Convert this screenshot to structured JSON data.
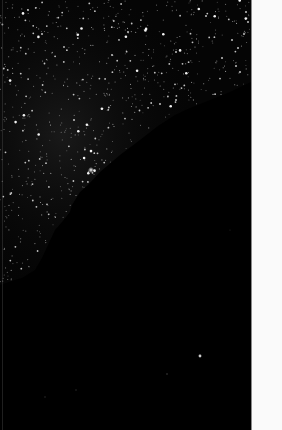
{
  "image": {
    "subject": "Night sky star field with dark landform silhouette",
    "colors": {
      "sky": "#050505",
      "silhouette": "#000000",
      "star": "#ffffff",
      "margin": "#fafafa",
      "margin_border": "#8a8a8a"
    },
    "regions": {
      "star_field": "upper-left",
      "silhouette": "lower-right diagonal",
      "margin_strip": "right edge, blank white"
    },
    "silhouette_boundary": [
      [
        251,
        82
      ],
      [
        230,
        92
      ],
      [
        210,
        100
      ],
      [
        190,
        108
      ],
      [
        175,
        115
      ],
      [
        158,
        126
      ],
      [
        140,
        140
      ],
      [
        120,
        155
      ],
      [
        100,
        172
      ],
      [
        88,
        185
      ],
      [
        80,
        192
      ],
      [
        72,
        205
      ],
      [
        70,
        212
      ],
      [
        62,
        222
      ],
      [
        55,
        230
      ],
      [
        48,
        245
      ],
      [
        42,
        258
      ],
      [
        35,
        270
      ],
      [
        22,
        278
      ],
      [
        15,
        280
      ],
      [
        0,
        285
      ]
    ],
    "brightest_star": [
      91,
      170
    ],
    "isolated_star_in_silhouette": [
      200,
      356
    ]
  }
}
